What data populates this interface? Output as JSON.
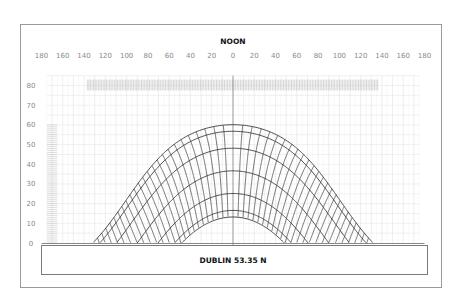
{
  "chart_data": {
    "type": "line",
    "title": "NOON",
    "caption": "DUBLIN 53.35 N",
    "latitude": 53.35,
    "xlabel": "Azimuth (degrees from south)",
    "ylabel": "Altitude (degrees)",
    "x_ticks": [
      180,
      160,
      140,
      120,
      100,
      80,
      60,
      40,
      20,
      0,
      20,
      40,
      60,
      80,
      100,
      120,
      140,
      160,
      180
    ],
    "y_ticks": [
      80,
      70,
      60,
      50,
      40,
      30,
      20,
      10,
      0
    ],
    "xlim": [
      -180,
      180
    ],
    "ylim": [
      0,
      80
    ],
    "grid": true,
    "noon_line_azimuth": 0,
    "date_curves_declination": [
      23.44,
      20.1,
      11.5,
      0.0,
      -11.5,
      -20.1,
      -23.44
    ],
    "date_curves_noon_altitude": [
      60.1,
      56.8,
      48.2,
      36.7,
      25.2,
      16.6,
      13.2
    ],
    "hour_line_step_minutes": 20,
    "hour_angle_range_deg": [
      -135,
      135
    ],
    "top_hatch_azimuth_range": [
      -137,
      137
    ],
    "left_hatch_altitude_range": [
      0,
      60
    ]
  },
  "colors": {
    "frame": "#9a9a9a",
    "grid": "#e3e3e3",
    "curve": "#3a3a3a",
    "noon_line": "#888888",
    "hatch": "#bdbdbd"
  }
}
